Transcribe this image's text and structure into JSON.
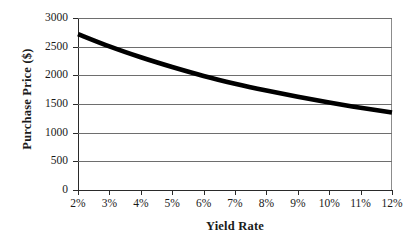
{
  "chart_data": {
    "type": "line",
    "title": "",
    "xlabel": "Yield Rate",
    "ylabel": "Purchase Price ($)",
    "x": [
      2,
      3,
      4,
      5,
      6,
      7,
      8,
      9,
      10,
      11,
      12
    ],
    "x_tick_labels": [
      "2%",
      "3%",
      "4%",
      "5%",
      "6%",
      "7%",
      "8%",
      "9%",
      "10%",
      "11%",
      "12%"
    ],
    "values": [
      2720,
      2505,
      2315,
      2145,
      1990,
      1855,
      1735,
      1625,
      1525,
      1435,
      1350
    ],
    "y_tick_labels": [
      "0",
      "500",
      "1000",
      "1500",
      "2000",
      "2500",
      "3000"
    ],
    "y_ticks": [
      0,
      500,
      1000,
      1500,
      2000,
      2500,
      3000
    ],
    "xlim": [
      2,
      12
    ],
    "ylim": [
      0,
      3000
    ],
    "grid": true,
    "legend": false,
    "legend_position": "none",
    "series_color": "#000000",
    "grid_color": "#6e6e6e",
    "axis_color": "#2a2a2a",
    "background_color": "#ffffff"
  }
}
